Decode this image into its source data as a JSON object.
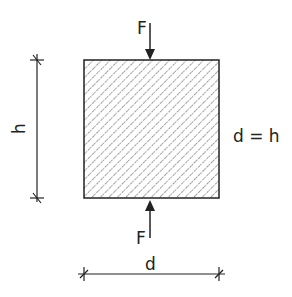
{
  "diagram": {
    "force_top_label": "F",
    "force_bottom_label": "F",
    "height_label": "h",
    "width_label": "d",
    "relation_label": "d = h",
    "colors": {
      "line": "#222222",
      "hatch": "#444444",
      "background": "#ffffff"
    }
  }
}
